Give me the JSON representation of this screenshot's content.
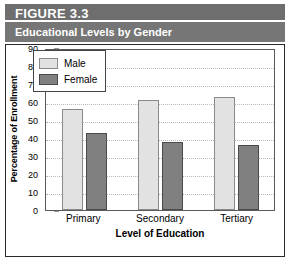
{
  "header": {
    "figure_number": "FIGURE 3.3",
    "subtitle": "Educational Levels by Gender"
  },
  "chart_data": {
    "type": "bar",
    "title": "Educational Levels by Gender",
    "categories": [
      "Primary",
      "Secondary",
      "Tertiary"
    ],
    "series": [
      {
        "name": "Male",
        "values": [
          56,
          61,
          63
        ],
        "color": "#e2e2e2"
      },
      {
        "name": "Female",
        "values": [
          43,
          38,
          36
        ],
        "color": "#808080"
      }
    ],
    "xlabel": "Level of Education",
    "ylabel": "Percentage of Enrollment",
    "ylim": [
      0,
      90
    ],
    "yticks": [
      90,
      80,
      70,
      60,
      50,
      40,
      30,
      20,
      10,
      0
    ],
    "ytick_labels": [
      "90",
      "80",
      "70",
      "60",
      "50",
      "40",
      "30",
      "20",
      "10",
      "0"
    ],
    "grid": true,
    "legend_position": "top-left-inside"
  },
  "legend": {
    "items": [
      {
        "label": "Male"
      },
      {
        "label": "Female"
      }
    ]
  }
}
